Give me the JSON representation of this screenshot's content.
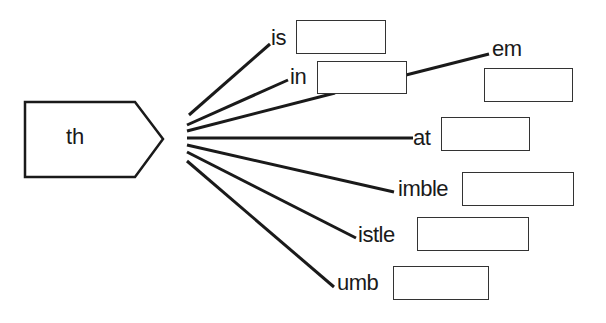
{
  "worksheet": {
    "stem": "th",
    "endings": [
      {
        "label": "is",
        "answer": ""
      },
      {
        "label": "in",
        "answer": ""
      },
      {
        "label": "em",
        "answer": ""
      },
      {
        "label": "at",
        "answer": ""
      },
      {
        "label": "imble",
        "answer": ""
      },
      {
        "label": "istle",
        "answer": ""
      },
      {
        "label": "umb",
        "answer": ""
      }
    ]
  }
}
